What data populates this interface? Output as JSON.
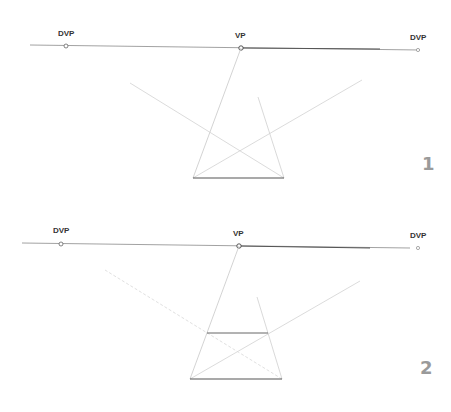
{
  "figures": [
    {
      "number": "1",
      "labels": {
        "left": "DVP",
        "center": "VP",
        "right": "DVP"
      }
    },
    {
      "number": "2",
      "labels": {
        "left": "DVP",
        "center": "VP",
        "right": "DVP"
      }
    }
  ],
  "colors": {
    "horizon": "#7a7a7a",
    "guide": "#d4d4d4",
    "edge": "#555555",
    "number": "#9a9a9a"
  }
}
